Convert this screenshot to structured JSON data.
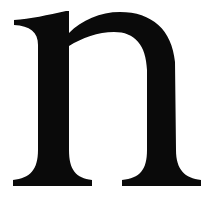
{
  "glyph": {
    "character": "n",
    "style": "serif lowercase",
    "color": "#0a0a0a",
    "background": "#ffffff"
  }
}
